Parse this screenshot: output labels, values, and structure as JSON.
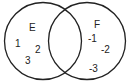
{
  "diagram": {
    "type": "venn",
    "sets": [
      {
        "name": "E",
        "elements": [
          "1",
          "2",
          "3"
        ]
      },
      {
        "name": "F",
        "elements": [
          "-1",
          "-2",
          "-3"
        ]
      }
    ],
    "intersection": []
  },
  "labels": {
    "set_e": "E",
    "set_f": "F",
    "e_items": [
      "1",
      "2",
      "3"
    ],
    "f_items": [
      "-1",
      "-2",
      "-3"
    ]
  },
  "colors": {
    "stroke": "#222222",
    "background": "#ffffff"
  }
}
